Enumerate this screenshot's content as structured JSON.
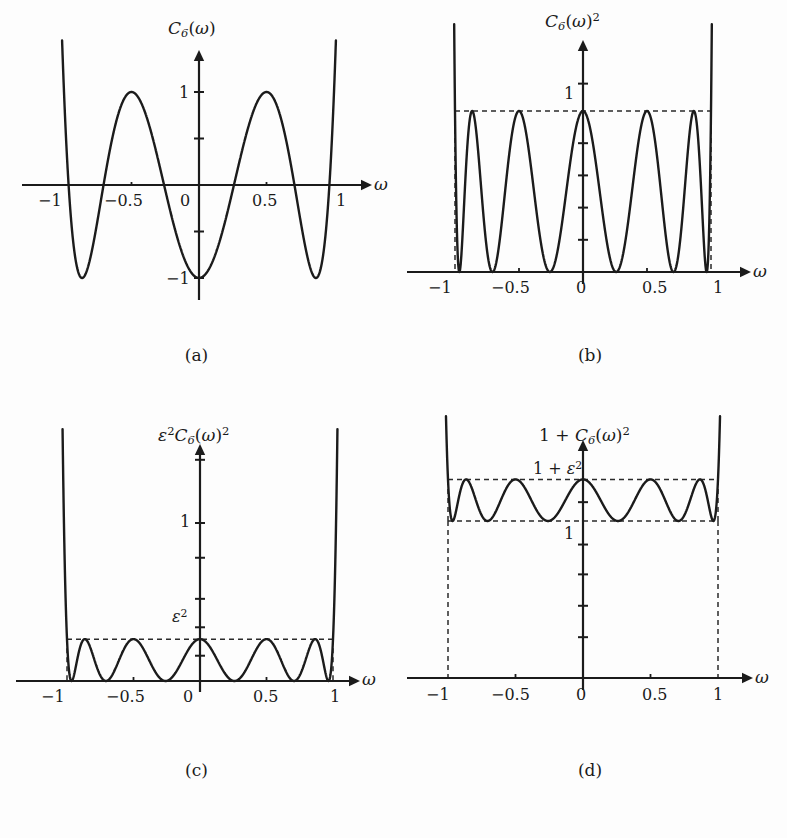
{
  "figure": {
    "title_caption_style": "lettered",
    "panels": [
      {
        "id": "a",
        "caption": "(a)",
        "ylabel_parts": {
          "base": "C",
          "sub": "6",
          "arg": "(ω)",
          "sup": ""
        },
        "ylabel_text": "C6(ω)",
        "xlabel": "ω",
        "xticks": [
          "−1",
          "−0.5",
          "0",
          "0.5",
          "1"
        ],
        "xtickvals": [
          -1,
          -0.5,
          0,
          0.5,
          1
        ],
        "yticks": [
          "1",
          "−1"
        ],
        "ytickvals": [
          1,
          -1
        ],
        "dashed": []
      },
      {
        "id": "b",
        "caption": "(b)",
        "ylabel_parts": {
          "base": "C",
          "sub": "6",
          "arg": "(ω)",
          "sup": "2"
        },
        "ylabel_text": "C6(ω)²",
        "xlabel": "ω",
        "xticks": [
          "−1",
          "−0.5",
          "0",
          "0.5",
          "1"
        ],
        "xtickvals": [
          -1,
          -0.5,
          0,
          0.5,
          1
        ],
        "yticks": [
          "1"
        ],
        "ytickvals": [
          1
        ],
        "dashed": [
          "y=1 envelope",
          "x=−1 vertical",
          "x=1 vertical"
        ]
      },
      {
        "id": "c",
        "caption": "(c)",
        "ylabel_parts": {
          "pre": "ε",
          "presup": "2",
          "base": "C",
          "sub": "6",
          "arg": "(ω)",
          "sup": "2"
        },
        "ylabel_text": "ε²C6(ω)²",
        "xlabel": "ω",
        "xticks": [
          "−1",
          "−0.5",
          "0",
          "0.5",
          "1"
        ],
        "xtickvals": [
          -1,
          -0.5,
          0,
          0.5,
          1
        ],
        "yticks": [
          "1",
          "ε²"
        ],
        "ytickvals": [
          1,
          0.12
        ],
        "dashed": [
          "y=ε² envelope",
          "x=−1 vertical",
          "x=1 vertical"
        ]
      },
      {
        "id": "d",
        "caption": "(d)",
        "ylabel_parts": {
          "pre": "1 + ",
          "base": "C",
          "sub": "6",
          "arg": "(ω)",
          "sup": "2"
        },
        "ylabel_text": "1 + C6(ω)²",
        "xlabel": "ω",
        "xticks": [
          "−1",
          "−0.5",
          "0",
          "0.5",
          "1"
        ],
        "xtickvals": [
          -1,
          -0.5,
          0,
          0.5,
          1
        ],
        "yticks": [
          "1 + ε²",
          "1"
        ],
        "ytickvals": [
          1.12,
          1
        ],
        "dashed": [
          "y=1+ε² envelope",
          "y=1 envelope",
          "x=−1 vertical",
          "x=1 vertical"
        ]
      }
    ]
  },
  "labels": {
    "omega": "ω",
    "epsilon": "ε",
    "C": "C",
    "six": "6",
    "one": "1",
    "minus_one": "−1",
    "half": "0.5",
    "minus_half": "−0.5",
    "zero": "0",
    "sq": "2",
    "one_plus": "1 + "
  },
  "chart_data": {
    "type": "line",
    "n": 6,
    "epsilon_squared": 0.12,
    "panels": [
      {
        "id": "a",
        "title": "C6(ω)",
        "expr": "cos(6*acos(w))",
        "xlabel": "ω",
        "ylabel": "C6(ω)",
        "xlim": [
          -1.12,
          1.12
        ],
        "ylim": [
          -1.45,
          1.45
        ],
        "xticks": [
          -1,
          -0.5,
          0,
          0.5,
          1
        ],
        "yticks": [
          -1,
          1
        ],
        "extrema_x": [
          -1,
          -0.866,
          -0.5,
          0,
          0.5,
          0.866,
          1
        ],
        "extrema_y": [
          1,
          -1,
          1,
          -1,
          1,
          -1,
          1
        ],
        "zeros_x": [
          -0.966,
          -0.707,
          -0.259,
          0.259,
          0.707,
          0.966
        ],
        "grid": false,
        "legend": false
      },
      {
        "id": "b",
        "title": "C6(ω)^2",
        "expr": "cos(6*acos(w))^2",
        "xlabel": "ω",
        "ylabel": "C6(ω)²",
        "xlim": [
          -1.1,
          1.1
        ],
        "ylim": [
          0,
          1.85
        ],
        "xticks": [
          -1,
          -0.5,
          0,
          0.5,
          1
        ],
        "yticks": [
          1
        ],
        "envelope_y": 1,
        "peaks_x": [
          -1,
          -0.866,
          -0.5,
          0,
          0.5,
          0.866,
          1
        ],
        "peaks_y": [
          1,
          1,
          1,
          1,
          1,
          1,
          1
        ],
        "zeros_x": [
          -0.966,
          -0.707,
          -0.259,
          0.259,
          0.707,
          0.966
        ],
        "grid": false,
        "legend": false
      },
      {
        "id": "c",
        "title": "eps^2 * C6(ω)^2",
        "expr": "eps^2*cos(6*acos(w))^2",
        "xlabel": "ω",
        "ylabel": "ε²C6(ω)²",
        "xlim": [
          -1.1,
          1.1
        ],
        "ylim": [
          0,
          1.75
        ],
        "xticks": [
          -1,
          -0.5,
          0,
          0.5,
          1
        ],
        "yticks": [
          0.12,
          1
        ],
        "envelope_y": 0.12,
        "peaks_x": [
          -1,
          -0.866,
          -0.5,
          0,
          0.5,
          0.866,
          1
        ],
        "peaks_y": [
          0.12,
          0.12,
          0.12,
          0.12,
          0.12,
          0.12,
          0.12
        ],
        "zeros_x": [
          -0.966,
          -0.707,
          -0.259,
          0.259,
          0.707,
          0.966
        ],
        "grid": false,
        "legend": false
      },
      {
        "id": "d",
        "title": "1 + C6(ω)^2",
        "expr": "1 + eps^2*cos(6*acos(w))^2",
        "xlabel": "ω",
        "ylabel": "1 + C6(ω)²",
        "xlim": [
          -1.1,
          1.1
        ],
        "ylim": [
          0,
          1.45
        ],
        "xticks": [
          -1,
          -0.5,
          0,
          0.5,
          1
        ],
        "yticks": [
          1,
          1.12
        ],
        "envelope_hi": 1.12,
        "envelope_lo": 1,
        "peaks_x": [
          -1,
          -0.866,
          -0.5,
          0,
          0.5,
          0.866,
          1
        ],
        "peaks_y": [
          1.12,
          1.12,
          1.12,
          1.12,
          1.12,
          1.12,
          1.12
        ],
        "troughs_x": [
          -0.966,
          -0.707,
          -0.259,
          0.259,
          0.707,
          0.966
        ],
        "troughs_y": [
          1,
          1,
          1,
          1,
          1,
          1
        ],
        "grid": false,
        "legend": false
      }
    ]
  }
}
